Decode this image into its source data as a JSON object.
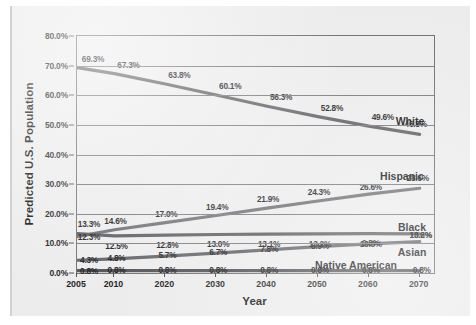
{
  "chart_data": {
    "type": "line",
    "title": "",
    "xlabel": "Year",
    "ylabel": "Predicted U.S. Population",
    "categories": [
      "2005",
      "2010",
      "2020",
      "2030",
      "2040",
      "2050",
      "2060",
      "2070"
    ],
    "x": [
      2005,
      2010,
      2020,
      2030,
      2040,
      2050,
      2060,
      2070
    ],
    "ylim": [
      0,
      80
    ],
    "yticks": [
      "0.0%",
      "10.0%",
      "20.0%",
      "30.0%",
      "40.0%",
      "50.0%",
      "60.0%",
      "70.0%",
      "80.0%"
    ],
    "ytick_values": [
      0,
      10,
      20,
      30,
      40,
      50,
      60,
      70,
      80
    ],
    "grid": "horizontal",
    "legend": "inline-right-labels",
    "value_labels": true,
    "series": [
      {
        "name": "White",
        "values": [
          69.3,
          67.3,
          63.8,
          60.1,
          56.3,
          52.8,
          49.6,
          46.8
        ],
        "labels": [
          "69.3%",
          "67.3%",
          "63.8%",
          "60.1%",
          "56.3%",
          "52.8%",
          "49.6%",
          "46.8%"
        ],
        "color": "#5d5d62"
      },
      {
        "name": "Hispanic",
        "values": [
          12.3,
          14.6,
          17.0,
          19.4,
          21.9,
          24.3,
          26.6,
          28.6
        ],
        "labels": [
          "12.3%",
          "14.6%",
          "17.0%",
          "19.4%",
          "21.9%",
          "24.3%",
          "26.6%",
          "28.6%"
        ],
        "color": "#6b6b70"
      },
      {
        "name": "Black",
        "values": [
          13.3,
          12.5,
          12.8,
          13.0,
          13.1,
          13.2,
          13.3,
          13.2
        ],
        "labels": [
          "13.3%",
          "12.5%",
          "12.8%",
          "13.0%",
          "13.1%",
          "13.2%",
          "13.3%",
          "13.2%"
        ],
        "color": "#58585d"
      },
      {
        "name": "Asian",
        "values": [
          4.3,
          4.8,
          5.7,
          6.7,
          7.8,
          8.9,
          9.8,
          10.6
        ],
        "labels": [
          "4.3%",
          "4.8%",
          "5.7%",
          "6.7%",
          "7.8%",
          "8.9%",
          "9.8%",
          "10.6%"
        ],
        "color": "#5f5f64"
      },
      {
        "name": "Native American",
        "values": [
          0.8,
          0.8,
          0.8,
          0.8,
          0.8,
          0.8,
          0.8,
          0.8
        ],
        "labels": [
          "0.8%",
          "0.8%",
          "0.8%",
          "0.8%",
          "0.8%",
          "0.8%",
          "0.8%",
          "0.8%"
        ],
        "color": "#4f4f54"
      }
    ],
    "series_name_labels": [
      {
        "name": "White",
        "text": "White"
      },
      {
        "name": "Hispanic",
        "text": "Hispanic"
      },
      {
        "name": "Black",
        "text": "Black"
      },
      {
        "name": "Asian",
        "text": "Asian"
      },
      {
        "name": "Native American",
        "text": "Native American"
      }
    ]
  }
}
